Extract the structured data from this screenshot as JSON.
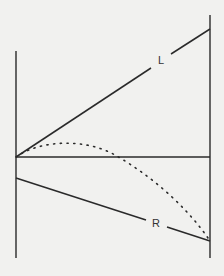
{
  "diagram": {
    "colors": {
      "background": "#f1f1ef",
      "ink": "#2a2a2a"
    },
    "labels": {
      "upper_line": "L",
      "lower_line": "R"
    },
    "elements": [
      {
        "id": "left-vertical",
        "type": "line",
        "from": [
          16,
          51
        ],
        "to": [
          16,
          258
        ]
      },
      {
        "id": "right-vertical",
        "type": "line",
        "from": [
          210,
          15
        ],
        "to": [
          210,
          258
        ]
      },
      {
        "id": "horizontal-axis",
        "type": "line",
        "from": [
          16,
          157
        ],
        "to": [
          210,
          157
        ]
      },
      {
        "id": "line-L",
        "type": "line",
        "from": [
          16,
          157
        ],
        "to": [
          210,
          29
        ],
        "label": "L"
      },
      {
        "id": "line-R",
        "type": "line",
        "from": [
          16,
          178
        ],
        "to": [
          210,
          241
        ],
        "label": "R"
      },
      {
        "id": "dotted-curve",
        "type": "dotted-curve",
        "from": [
          16,
          157
        ],
        "peak": [
          65,
          144
        ],
        "to": [
          208,
          238
        ]
      }
    ]
  }
}
